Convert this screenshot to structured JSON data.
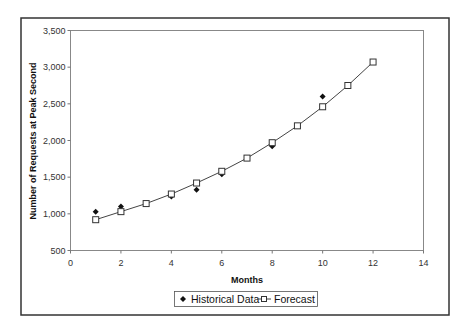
{
  "chart_data": {
    "type": "scatter",
    "title": "",
    "xlabel": "Months",
    "ylabel": "Number of Requests at Peak Second",
    "xlim": [
      0,
      14
    ],
    "ylim": [
      500,
      3500
    ],
    "x_ticks": [
      0,
      2,
      4,
      6,
      8,
      10,
      12,
      14
    ],
    "y_ticks": [
      500,
      1000,
      1500,
      2000,
      2500,
      3000,
      3500
    ],
    "y_tick_labels": [
      "500",
      "1,000",
      "1,500",
      "2,000",
      "2,500",
      "3,000",
      "3,500"
    ],
    "grid": false,
    "legend_position": "bottom",
    "series": [
      {
        "name": "Historical Data",
        "style": "marker-only",
        "marker": "filled-diamond",
        "x": [
          1,
          2,
          4,
          5,
          6,
          8,
          10
        ],
        "values": [
          1030,
          1100,
          1235,
          1330,
          1540,
          1920,
          2600
        ]
      },
      {
        "name": "Forecast",
        "style": "line-with-marker",
        "marker": "open-square",
        "x": [
          1,
          2,
          3,
          4,
          5,
          6,
          7,
          8,
          9,
          10,
          11,
          12
        ],
        "values": [
          920,
          1030,
          1140,
          1270,
          1420,
          1580,
          1760,
          1970,
          2200,
          2460,
          2750,
          3070
        ]
      }
    ]
  },
  "legend": {
    "items": [
      {
        "label": "Historical Data"
      },
      {
        "label": "Forecast"
      }
    ]
  },
  "colors": {
    "frame": "#333333",
    "axis": "#777777",
    "line": "#444444",
    "marker": "#111111"
  }
}
